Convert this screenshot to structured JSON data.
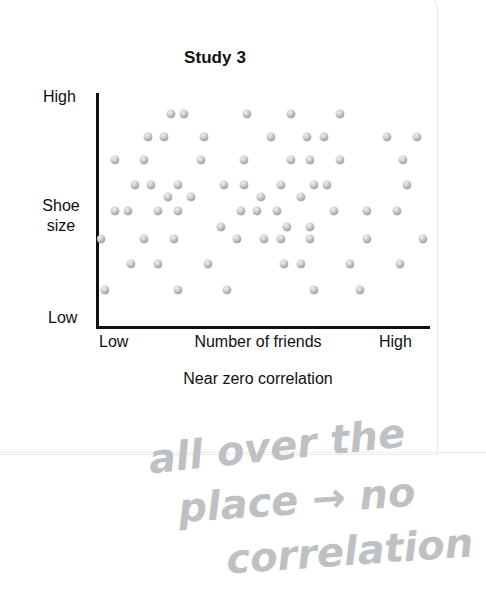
{
  "card": {
    "background_color": "#ffffff",
    "border_color": "#e9e9ec"
  },
  "chart_data": {
    "type": "scatter",
    "title": "Study 3",
    "xlabel": "Number of friends",
    "ylabel": "Shoe size",
    "caption": "Near zero correlation",
    "grid": false,
    "legend": null,
    "xlim": [
      0,
      100
    ],
    "ylim": [
      0,
      100
    ],
    "xtick_labels": [
      "Low",
      "High"
    ],
    "ytick_labels": [
      "Low",
      "High"
    ],
    "dot_color": "#9a9a9a",
    "axis_color": "#111111",
    "n_points": 94,
    "points": [
      [
        22,
        92
      ],
      [
        26,
        92
      ],
      [
        45,
        92
      ],
      [
        58,
        92
      ],
      [
        73,
        92
      ],
      [
        15,
        82
      ],
      [
        20,
        82
      ],
      [
        32,
        82
      ],
      [
        52,
        82
      ],
      [
        63,
        82
      ],
      [
        68,
        82
      ],
      [
        87,
        82
      ],
      [
        96,
        82
      ],
      [
        5,
        72
      ],
      [
        14,
        72
      ],
      [
        31,
        72
      ],
      [
        44,
        72
      ],
      [
        58,
        72
      ],
      [
        64,
        72
      ],
      [
        73,
        72
      ],
      [
        92,
        72
      ],
      [
        11,
        61
      ],
      [
        16,
        61
      ],
      [
        24,
        61
      ],
      [
        38,
        61
      ],
      [
        44,
        61
      ],
      [
        55,
        61
      ],
      [
        65,
        61
      ],
      [
        69,
        61
      ],
      [
        93,
        61
      ],
      [
        21,
        56
      ],
      [
        28,
        56
      ],
      [
        49,
        56
      ],
      [
        61,
        56
      ],
      [
        5,
        50
      ],
      [
        9,
        50
      ],
      [
        18,
        50
      ],
      [
        24,
        50
      ],
      [
        43,
        50
      ],
      [
        48,
        50
      ],
      [
        54,
        50
      ],
      [
        71,
        50
      ],
      [
        81,
        50
      ],
      [
        90,
        50
      ],
      [
        37,
        43
      ],
      [
        57,
        43
      ],
      [
        64,
        43
      ],
      [
        1,
        38
      ],
      [
        14,
        38
      ],
      [
        23,
        38
      ],
      [
        42,
        38
      ],
      [
        50,
        38
      ],
      [
        55,
        38
      ],
      [
        64,
        38
      ],
      [
        81,
        38
      ],
      [
        98,
        38
      ],
      [
        10,
        27
      ],
      [
        18,
        27
      ],
      [
        33,
        27
      ],
      [
        56,
        27
      ],
      [
        61,
        27
      ],
      [
        76,
        27
      ],
      [
        91,
        27
      ],
      [
        2,
        16
      ],
      [
        24,
        16
      ],
      [
        39,
        16
      ],
      [
        65,
        16
      ],
      [
        79,
        16
      ]
    ]
  },
  "annotation": {
    "text": "all over the place → no correlation",
    "line_1": "all over the",
    "line_2": "place → no",
    "line_3": "correlation",
    "ink_color": "#b9bcc0"
  }
}
